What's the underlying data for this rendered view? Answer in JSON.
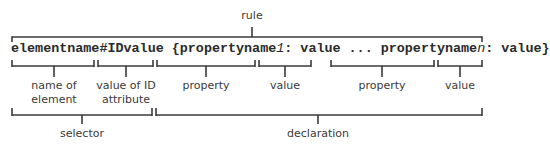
{
  "title_label": "rule",
  "code": {
    "selector_name": "elementname",
    "hash": "#",
    "id_value": "IDvalue",
    "open_brace": " {",
    "property1_prefix": "propertyname",
    "property1_suffix": "1",
    "colon1": ": ",
    "value1": "value",
    "ellipsis": " ... ",
    "propertyn_prefix": "propertyname",
    "propertyn_suffix": "n",
    "colonn": ": ",
    "valuen": "value",
    "close_brace": "}"
  },
  "part_labels": [
    {
      "line1": "name of",
      "line2": "element"
    },
    {
      "line1": "value of ID",
      "line2": "attribute"
    },
    {
      "line1": "property",
      "line2": ""
    },
    {
      "line1": "value",
      "line2": ""
    },
    {
      "line1": "property",
      "line2": ""
    },
    {
      "line1": "value",
      "line2": ""
    }
  ],
  "group_labels": {
    "selector": "selector",
    "declaration": "declaration"
  }
}
